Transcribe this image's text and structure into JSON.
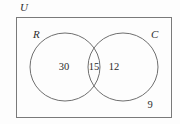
{
  "diagram": {
    "type": "venn",
    "universe_label": "U",
    "sets": [
      {
        "id": "R",
        "label": "R",
        "count_only": "30"
      },
      {
        "id": "C",
        "label": "C",
        "count_only": "12"
      }
    ],
    "intersection_count": "15",
    "outside_count": "9",
    "colors": {
      "stroke": "#7a7a7a",
      "text": "#2b2b2b",
      "background": "#fdfdfd"
    }
  }
}
